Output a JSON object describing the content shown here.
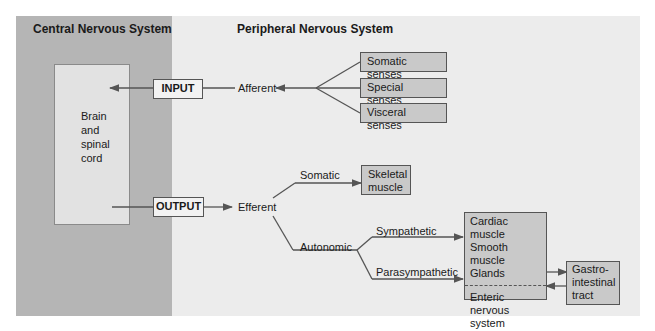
{
  "headers": {
    "cns": "Central Nervous System",
    "pns": "Peripheral Nervous System"
  },
  "cns_box": {
    "lines": [
      "Brain",
      "and",
      "spinal",
      "cord"
    ]
  },
  "input": {
    "label": "INPUT",
    "afferent": "Afferent",
    "senses": [
      "Somatic senses",
      "Special senses",
      "Visceral senses"
    ]
  },
  "output": {
    "label": "OUTPUT",
    "efferent": "Efferent",
    "somatic": "Somatic",
    "skeletal_muscle": [
      "Skeletal",
      "muscle"
    ],
    "autonomic": "Autonomic",
    "sympathetic": "Sympathetic",
    "parasympathetic": "Parasympathetic",
    "targets_top": [
      "Cardiac muscle",
      "Smooth muscle",
      "Glands"
    ],
    "targets_bottom": [
      "Enteric nervous",
      "system"
    ],
    "gi_tract": [
      "Gastro-",
      "intestinal",
      "tract"
    ]
  },
  "colors": {
    "cns_bg": "#b5b5b5",
    "pns_bg": "#ececec",
    "box_fill": "#c9c9c9",
    "line": "#555555"
  }
}
